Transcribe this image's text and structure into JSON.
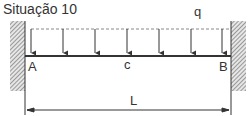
{
  "title": "Situação 10",
  "labels": {
    "load": "q",
    "left_support": "A",
    "right_support": "B",
    "midpoint": "c",
    "length": "L"
  },
  "diagram": {
    "type": "fixed-fixed beam with uniformly distributed load",
    "load_arrow_count": 7,
    "colors": {
      "line": "#333333",
      "hatch": "#777777",
      "dashed": "#888888"
    }
  }
}
